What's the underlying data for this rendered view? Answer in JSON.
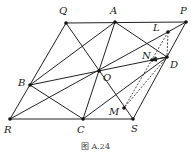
{
  "caption": "图 A.24",
  "points": {
    "Q": {
      "label": "Q",
      "x": 66,
      "y": 23
    },
    "A": {
      "label": "A",
      "x": 115,
      "y": 22
    },
    "P": {
      "label": "P",
      "x": 186,
      "y": 22
    },
    "L": {
      "label": "L",
      "x": 168,
      "y": 32
    },
    "N": {
      "label": "N",
      "x": 152,
      "y": 60
    },
    "D": {
      "label": "D",
      "x": 167,
      "y": 57
    },
    "O": {
      "label": "O",
      "x": 99,
      "y": 71
    },
    "B": {
      "label": "B",
      "x": 30,
      "y": 85
    },
    "M": {
      "label": "M",
      "x": 124,
      "y": 108
    },
    "R": {
      "label": "R",
      "x": 10,
      "y": 119
    },
    "C": {
      "label": "C",
      "x": 83,
      "y": 119
    },
    "S": {
      "label": "S",
      "x": 133,
      "y": 119
    }
  },
  "solid_segments": [
    [
      "Q",
      "P"
    ],
    [
      "R",
      "S"
    ],
    [
      "Q",
      "R"
    ],
    [
      "P",
      "S"
    ],
    [
      "A",
      "B"
    ],
    [
      "A",
      "C"
    ],
    [
      "A",
      "D"
    ],
    [
      "B",
      "D"
    ],
    [
      "R",
      "P"
    ],
    [
      "Q",
      "S"
    ],
    [
      "B",
      "C"
    ],
    [
      "C",
      "D"
    ]
  ],
  "dashed_segments": [
    [
      "L",
      "D"
    ],
    [
      "L",
      "M"
    ],
    [
      "D",
      "M"
    ]
  ],
  "arrows": [
    [
      "D",
      "N"
    ]
  ],
  "colors": {
    "line": "#222222",
    "point": "#111111"
  }
}
